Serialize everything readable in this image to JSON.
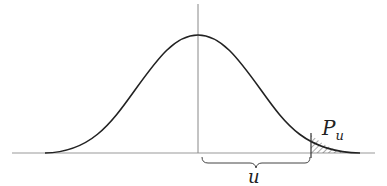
{
  "diagram": {
    "type": "normal-distribution-tail",
    "labels": {
      "tail_probability": "P",
      "tail_subscript": "u",
      "distance": "u"
    },
    "colors": {
      "curve": "#222222",
      "axis": "#999999",
      "hatch": "#555555"
    }
  }
}
